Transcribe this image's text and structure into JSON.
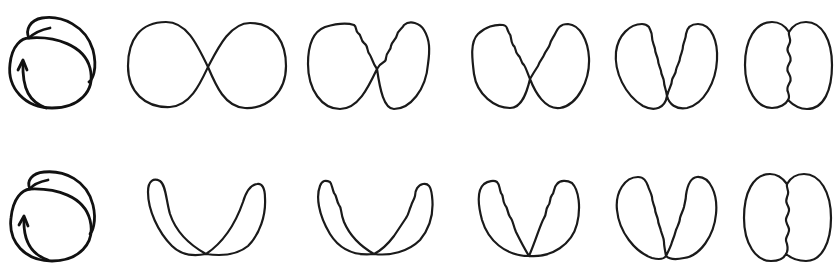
{
  "figure": {
    "description": "Two rows of six line drawings each; row 1 shows a rotating loop transforming from a figure-eight into two adjoining lobes; row 2 shows a U-shaped loop transforming into two adjoining lobes",
    "ink_color": "#1a1a1a",
    "background": "#ffffff",
    "rows": [
      {
        "id": "row-1",
        "panels": [
          {
            "id": "r1-p1",
            "shape": "circular-loop-with-arrow"
          },
          {
            "id": "r1-p2",
            "shape": "figure-eight"
          },
          {
            "id": "r1-p3",
            "shape": "figure-eight-wavy-inner-edges"
          },
          {
            "id": "r1-p4",
            "shape": "two-lobes-touching-wavy"
          },
          {
            "id": "r1-p5",
            "shape": "two-lobes-v-wavy"
          },
          {
            "id": "r1-p6",
            "shape": "two-lobes-joined-wavy-seam"
          }
        ]
      },
      {
        "id": "row-2",
        "panels": [
          {
            "id": "r2-p1",
            "shape": "circular-loop-with-arrow"
          },
          {
            "id": "r2-p2",
            "shape": "u-shaped-loop"
          },
          {
            "id": "r2-p3",
            "shape": "u-shaped-loop-wavy"
          },
          {
            "id": "r2-p4",
            "shape": "v-shaped-lobes-wavy"
          },
          {
            "id": "r2-p5",
            "shape": "two-lobes-v-wavy"
          },
          {
            "id": "r2-p6",
            "shape": "two-lobes-joined-wavy-seam"
          }
        ]
      }
    ]
  }
}
